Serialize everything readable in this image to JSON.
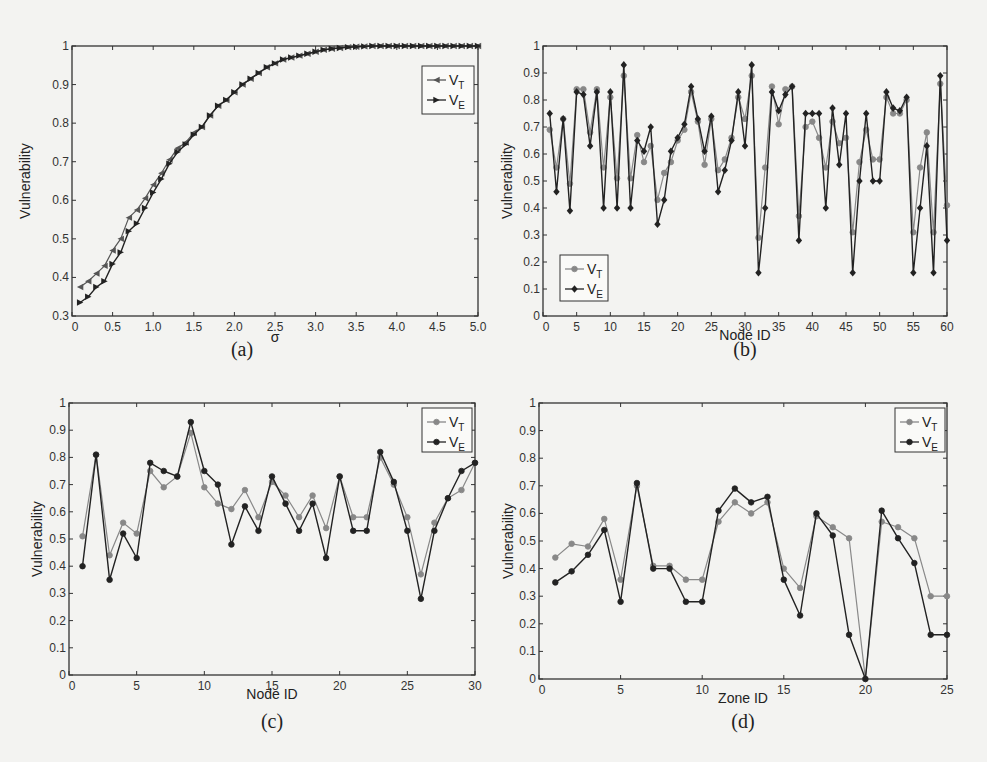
{
  "figure": {
    "panels": [
      "(a)",
      "(b)",
      "(c)",
      "(d)"
    ]
  },
  "chart_data": [
    {
      "id": "a",
      "type": "line",
      "panel_label": "(a)",
      "xlabel": "σ",
      "ylabel": "Vulnerability",
      "xlim": [
        0,
        5.0
      ],
      "ylim": [
        0.3,
        1
      ],
      "xticks": [
        "0",
        "0.5",
        "1.0",
        "1.5",
        "2.0",
        "2.5",
        "3.0",
        "3.5",
        "4.0",
        "4.5",
        "5.0"
      ],
      "yticks": [
        "0.3",
        "0.4",
        "0.5",
        "0.6",
        "0.7",
        "0.8",
        "0.9",
        "1"
      ],
      "legend": {
        "position": "top-right",
        "entries": [
          "V_T",
          "V_E"
        ]
      },
      "x": [
        0.1,
        0.2,
        0.3,
        0.4,
        0.5,
        0.6,
        0.7,
        0.8,
        0.9,
        1.0,
        1.1,
        1.2,
        1.3,
        1.4,
        1.5,
        1.6,
        1.7,
        1.8,
        1.9,
        2.0,
        2.1,
        2.2,
        2.3,
        2.4,
        2.5,
        2.6,
        2.7,
        2.8,
        2.9,
        3.0,
        3.1,
        3.2,
        3.3,
        3.4,
        3.5,
        3.6,
        3.7,
        3.8,
        3.9,
        4.0,
        4.1,
        4.2,
        4.3,
        4.4,
        4.5,
        4.6,
        4.7,
        4.8,
        4.9,
        5.0
      ],
      "series": [
        {
          "name": "V_T",
          "marker": "triangle-left",
          "color": "#555555",
          "values": [
            0.375,
            0.39,
            0.41,
            0.43,
            0.47,
            0.5,
            0.555,
            0.575,
            0.605,
            0.64,
            0.67,
            0.705,
            0.735,
            0.75,
            0.775,
            0.79,
            0.82,
            0.845,
            0.86,
            0.88,
            0.9,
            0.915,
            0.93,
            0.945,
            0.955,
            0.965,
            0.97,
            0.975,
            0.98,
            0.985,
            0.99,
            0.993,
            0.995,
            0.997,
            0.998,
            0.999,
            1,
            1,
            1,
            1,
            1,
            1,
            1,
            1,
            1,
            1,
            1,
            1,
            1,
            1
          ]
        },
        {
          "name": "V_E",
          "marker": "triangle-right",
          "color": "#222222",
          "values": [
            0.335,
            0.35,
            0.375,
            0.39,
            0.435,
            0.465,
            0.52,
            0.54,
            0.58,
            0.62,
            0.655,
            0.695,
            0.725,
            0.745,
            0.77,
            0.79,
            0.82,
            0.845,
            0.86,
            0.88,
            0.9,
            0.915,
            0.93,
            0.945,
            0.955,
            0.965,
            0.97,
            0.975,
            0.98,
            0.985,
            0.99,
            0.993,
            0.995,
            0.997,
            0.998,
            0.999,
            1,
            1,
            1,
            1,
            1,
            1,
            1,
            1,
            1,
            1,
            1,
            1,
            1,
            1
          ]
        }
      ]
    },
    {
      "id": "b",
      "type": "line",
      "panel_label": "(b)",
      "xlabel": "Node ID",
      "ylabel": "Vulnerability",
      "xlim": [
        0,
        60
      ],
      "ylim": [
        0,
        1
      ],
      "xticks": [
        "0",
        "5",
        "10",
        "15",
        "20",
        "25",
        "30",
        "35",
        "40",
        "45",
        "50",
        "55",
        "60"
      ],
      "yticks": [
        "0",
        "0.1",
        "0.2",
        "0.3",
        "0.4",
        "0.5",
        "0.6",
        "0.7",
        "0.8",
        "0.9",
        "1"
      ],
      "legend": {
        "position": "bottom-left",
        "entries": [
          "V_T",
          "V_E"
        ]
      },
      "x": [
        1,
        2,
        3,
        4,
        5,
        6,
        7,
        8,
        9,
        10,
        11,
        12,
        13,
        14,
        15,
        16,
        17,
        18,
        19,
        20,
        21,
        22,
        23,
        24,
        25,
        26,
        27,
        28,
        29,
        30,
        31,
        32,
        33,
        34,
        35,
        36,
        37,
        38,
        39,
        40,
        41,
        42,
        43,
        44,
        45,
        46,
        47,
        48,
        49,
        50,
        51,
        52,
        53,
        54,
        55,
        56,
        57,
        58,
        59,
        60
      ],
      "series": [
        {
          "name": "V_T",
          "marker": "circle",
          "color": "#888888",
          "values": [
            0.69,
            0.55,
            0.73,
            0.49,
            0.84,
            0.84,
            0.68,
            0.84,
            0.55,
            0.81,
            0.51,
            0.89,
            0.51,
            0.67,
            0.57,
            0.63,
            0.43,
            0.53,
            0.57,
            0.65,
            0.69,
            0.83,
            0.72,
            0.56,
            0.73,
            0.54,
            0.58,
            0.66,
            0.81,
            0.73,
            0.89,
            0.29,
            0.55,
            0.85,
            0.71,
            0.84,
            0.85,
            0.37,
            0.7,
            0.72,
            0.66,
            0.55,
            0.72,
            0.64,
            0.66,
            0.31,
            0.57,
            0.69,
            0.58,
            0.58,
            0.81,
            0.75,
            0.75,
            0.8,
            0.31,
            0.55,
            0.68,
            0.31,
            0.86,
            0.41
          ]
        },
        {
          "name": "V_E",
          "marker": "diamond",
          "color": "#222222",
          "values": [
            0.75,
            0.46,
            0.73,
            0.39,
            0.83,
            0.82,
            0.63,
            0.83,
            0.4,
            0.83,
            0.4,
            0.93,
            0.4,
            0.65,
            0.61,
            0.7,
            0.34,
            0.43,
            0.61,
            0.66,
            0.71,
            0.85,
            0.73,
            0.61,
            0.74,
            0.46,
            0.54,
            0.65,
            0.83,
            0.63,
            0.93,
            0.16,
            0.4,
            0.83,
            0.76,
            0.82,
            0.85,
            0.28,
            0.75,
            0.75,
            0.75,
            0.4,
            0.77,
            0.56,
            0.75,
            0.16,
            0.5,
            0.75,
            0.5,
            0.5,
            0.83,
            0.77,
            0.76,
            0.81,
            0.16,
            0.4,
            0.63,
            0.16,
            0.89,
            0.28
          ]
        }
      ]
    },
    {
      "id": "c",
      "type": "line",
      "panel_label": "(c)",
      "xlabel": "Node ID",
      "ylabel": "Vulnerability",
      "xlim": [
        0,
        30
      ],
      "ylim": [
        0,
        1
      ],
      "xticks": [
        "0",
        "5",
        "10",
        "15",
        "20",
        "25",
        "30"
      ],
      "yticks": [
        "0",
        "0.1",
        "0.2",
        "0.3",
        "0.4",
        "0.5",
        "0.6",
        "0.7",
        "0.8",
        "0.9",
        "1"
      ],
      "legend": {
        "position": "top-right",
        "entries": [
          "V_T",
          "V_E"
        ]
      },
      "x": [
        1,
        2,
        3,
        4,
        5,
        6,
        7,
        8,
        9,
        10,
        11,
        12,
        13,
        14,
        15,
        16,
        17,
        18,
        19,
        20,
        21,
        22,
        23,
        24,
        25,
        26,
        27,
        28,
        29,
        30
      ],
      "series": [
        {
          "name": "V_T",
          "marker": "circle",
          "color": "#888888",
          "values": [
            0.51,
            0.81,
            0.44,
            0.56,
            0.52,
            0.75,
            0.69,
            0.73,
            0.89,
            0.69,
            0.63,
            0.61,
            0.68,
            0.58,
            0.71,
            0.66,
            0.58,
            0.66,
            0.54,
            0.73,
            0.58,
            0.58,
            0.8,
            0.7,
            0.58,
            0.37,
            0.56,
            0.65,
            0.68,
            0.78
          ]
        },
        {
          "name": "V_E",
          "marker": "circle",
          "color": "#222222",
          "values": [
            0.4,
            0.81,
            0.35,
            0.52,
            0.43,
            0.78,
            0.75,
            0.73,
            0.93,
            0.75,
            0.7,
            0.48,
            0.62,
            0.53,
            0.73,
            0.63,
            0.53,
            0.63,
            0.43,
            0.73,
            0.53,
            0.53,
            0.82,
            0.71,
            0.53,
            0.28,
            0.53,
            0.65,
            0.75,
            0.78
          ]
        }
      ]
    },
    {
      "id": "d",
      "type": "line",
      "panel_label": "(d)",
      "xlabel": "Zone ID",
      "ylabel": "Vulnerability",
      "xlim": [
        0,
        25
      ],
      "ylim": [
        0,
        1
      ],
      "xticks": [
        "0",
        "5",
        "10",
        "15",
        "20",
        "25"
      ],
      "yticks": [
        "0",
        "0.1",
        "0.2",
        "0.3",
        "0.4",
        "0.5",
        "0.6",
        "0.7",
        "0.8",
        "0.9",
        "1"
      ],
      "legend": {
        "position": "top-right",
        "entries": [
          "V_T",
          "V_E"
        ]
      },
      "x": [
        1,
        2,
        3,
        4,
        5,
        6,
        7,
        8,
        9,
        10,
        11,
        12,
        13,
        14,
        15,
        16,
        17,
        18,
        19,
        20,
        21,
        22,
        23,
        24,
        25
      ],
      "series": [
        {
          "name": "V_T",
          "marker": "circle",
          "color": "#888888",
          "values": [
            0.44,
            0.49,
            0.48,
            0.58,
            0.36,
            0.7,
            0.41,
            0.41,
            0.36,
            0.36,
            0.57,
            0.64,
            0.6,
            0.64,
            0.4,
            0.33,
            0.59,
            0.55,
            0.51,
            0.0,
            0.57,
            0.55,
            0.51,
            0.3,
            0.3
          ]
        },
        {
          "name": "V_E",
          "marker": "circle",
          "color": "#222222",
          "values": [
            0.35,
            0.39,
            0.45,
            0.54,
            0.28,
            0.71,
            0.4,
            0.4,
            0.28,
            0.28,
            0.61,
            0.69,
            0.64,
            0.66,
            0.36,
            0.23,
            0.6,
            0.52,
            0.16,
            0.0,
            0.61,
            0.51,
            0.42,
            0.16,
            0.16
          ]
        }
      ]
    }
  ]
}
